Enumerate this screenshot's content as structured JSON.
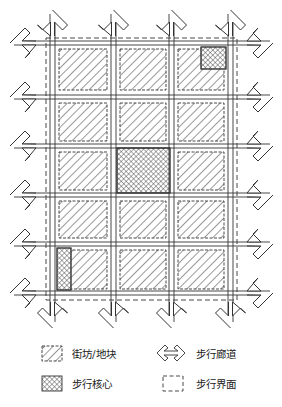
{
  "diagram": {
    "type": "pedestrian-grid-plan",
    "grid": {
      "columns": 3,
      "rows": 5
    },
    "colors": {
      "stroke": "#333333",
      "background": "#ffffff"
    },
    "pedestrian_cores": [
      {
        "location": "top-right block, upper-right corner"
      },
      {
        "location": "center block (row 3, column 2)"
      },
      {
        "location": "bottom-left block, left strip"
      }
    ]
  },
  "legend": {
    "items": [
      {
        "symbol": "hatched-block",
        "label": "街坊/地块"
      },
      {
        "symbol": "double-arrow",
        "label": "步行廊道"
      },
      {
        "symbol": "crosshatch-block",
        "label": "步行核心"
      },
      {
        "symbol": "dashed-box",
        "label": "步行界面"
      }
    ]
  }
}
